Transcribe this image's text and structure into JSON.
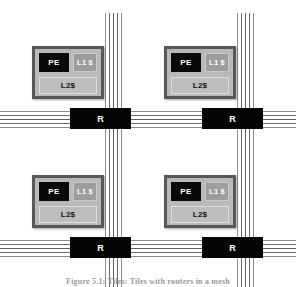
{
  "figure": {
    "caption": "Figure 5.1:  Tiles: Tiles with routers in a mesh"
  },
  "colors": {
    "tile_border": "#585858",
    "tile_fill": "#b9b9b9",
    "pe_fill": "#0a0a0a",
    "l1_fill": "#9d9d9d",
    "l2_fill": "#bdbdbd",
    "router_fill": "#050505",
    "wire": "#6e6e6e",
    "background": "#ffffff"
  },
  "tiles": [
    {
      "id": "tile-0",
      "position": "top-left",
      "pe_label": "PE",
      "l1_label": "L1 $",
      "l2_label": "L2$"
    },
    {
      "id": "tile-1",
      "position": "top-right",
      "pe_label": "PE",
      "l1_label": "L1 $",
      "l2_label": "L2$"
    },
    {
      "id": "tile-2",
      "position": "bottom-left",
      "pe_label": "PE",
      "l1_label": "L1 $",
      "l2_label": "L2$"
    },
    {
      "id": "tile-3",
      "position": "bottom-right",
      "pe_label": "PE",
      "l1_label": "L1 $",
      "l2_label": "L2$"
    }
  ],
  "routers": [
    {
      "id": "router-0",
      "label": "R",
      "position": "top-left"
    },
    {
      "id": "router-1",
      "label": "R",
      "position": "top-right"
    },
    {
      "id": "router-2",
      "label": "R",
      "position": "bottom-left"
    },
    {
      "id": "router-3",
      "label": "R",
      "position": "bottom-right"
    }
  ],
  "wire_bundles": {
    "horizontal_count": 2,
    "vertical_count": 2,
    "wires_per_bundle": 5
  }
}
